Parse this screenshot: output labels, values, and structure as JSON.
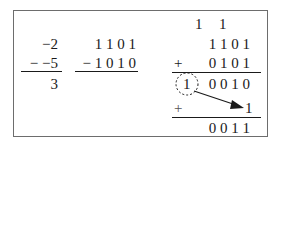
{
  "decimal": {
    "minuend": "−2",
    "subtrahend": "− −5",
    "result": "3"
  },
  "binary_subtraction": {
    "minuend": "1 1 0 1",
    "subtrahend": "− 1 0 1 0"
  },
  "twos_complement_addition": {
    "carries": [
      "1",
      "1"
    ],
    "addend1": "1 1 0 1",
    "operator": "+",
    "addend2": "0 1 0 1",
    "overflow_bit": "1",
    "partial_sum": "0 0 1 0",
    "end_around_operator": "+",
    "end_around_bit": "1",
    "final_result": "0 0 1 1"
  }
}
